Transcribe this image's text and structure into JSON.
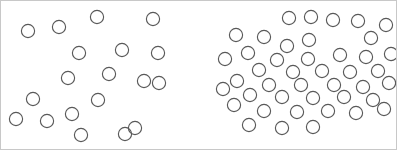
{
  "image": {
    "title": "Two-array circle numerosity comparison stimulus",
    "width": 397,
    "height": 150,
    "background_color": "#ffffff",
    "border_color": "#c8c8c8"
  },
  "style": {
    "circle_stroke_color": "#595959",
    "circle_fill": "none",
    "circle_stroke_width": 1.15,
    "circle_radius": 6.6,
    "circle_diameter": 13.2
  },
  "chart_data": {
    "type": "scatter",
    "subtitle": "",
    "xlabel": "",
    "ylabel": "",
    "xlim": [
      0,
      397
    ],
    "ylim": [
      0,
      150
    ],
    "grid": false,
    "legend_position": "none",
    "marker": "open-circle",
    "y_axis_inverted": true,
    "annotations": [],
    "series": [
      {
        "name": "left-sparse-array",
        "count": 19,
        "marker_radius": 6.6,
        "stroke": "#595959",
        "points": [
          [
            27,
            30
          ],
          [
            58,
            26
          ],
          [
            96,
            16
          ],
          [
            152,
            18
          ],
          [
            78,
            52
          ],
          [
            121,
            49
          ],
          [
            157,
            52
          ],
          [
            67,
            77
          ],
          [
            143,
            80
          ],
          [
            158,
            82
          ],
          [
            32,
            98
          ],
          [
            97,
            99
          ],
          [
            46,
            120
          ],
          [
            71,
            113
          ],
          [
            80,
            134
          ],
          [
            134,
            127
          ],
          [
            124,
            133
          ],
          [
            15,
            118
          ],
          [
            108,
            73
          ]
        ]
      },
      {
        "name": "right-dense-array",
        "count": 43,
        "marker_radius": 6.6,
        "stroke": "#595959",
        "points": [
          [
            288,
            17
          ],
          [
            310,
            16
          ],
          [
            332,
            19
          ],
          [
            357,
            20
          ],
          [
            385,
            24
          ],
          [
            263,
            36
          ],
          [
            308,
            39
          ],
          [
            370,
            37
          ],
          [
            235,
            34
          ],
          [
            286,
            45
          ],
          [
            247,
            52
          ],
          [
            276,
            59
          ],
          [
            307,
            58
          ],
          [
            339,
            54
          ],
          [
            365,
            56
          ],
          [
            390,
            53
          ],
          [
            224,
            58
          ],
          [
            258,
            69
          ],
          [
            292,
            71
          ],
          [
            321,
            70
          ],
          [
            349,
            71
          ],
          [
            377,
            70
          ],
          [
            236,
            80
          ],
          [
            268,
            84
          ],
          [
            300,
            84
          ],
          [
            333,
            84
          ],
          [
            362,
            86
          ],
          [
            388,
            82
          ],
          [
            222,
            88
          ],
          [
            249,
            94
          ],
          [
            281,
            96
          ],
          [
            312,
            97
          ],
          [
            343,
            96
          ],
          [
            372,
            99
          ],
          [
            233,
            104
          ],
          [
            263,
            110
          ],
          [
            296,
            111
          ],
          [
            327,
            110
          ],
          [
            355,
            112
          ],
          [
            383,
            108
          ],
          [
            248,
            124
          ],
          [
            281,
            127
          ],
          [
            312,
            126
          ]
        ]
      }
    ]
  }
}
